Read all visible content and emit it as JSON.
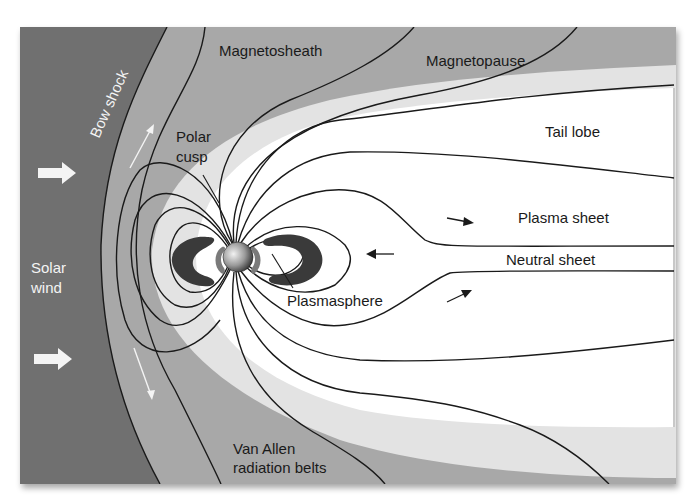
{
  "diagram": {
    "labels": {
      "magnetosheath": "Magnetosheath",
      "magnetopause": "Magnetopause",
      "bow_shock": "Bow shock",
      "polar_cusp_line1": "Polar",
      "polar_cusp_line2": "cusp",
      "tail_lobe": "Tail lobe",
      "plasma_sheet": "Plasma sheet",
      "neutral_sheet": "Neutral sheet",
      "solar_wind_line1": "Solar",
      "solar_wind_line2": "wind",
      "plasmasphere": "Plasmasphere",
      "van_allen_line1": "Van Allen",
      "van_allen_line2": "radiation belts"
    },
    "colors": {
      "solar_wind": "#6f6f6f",
      "magnetosheath": "#a8a8a8",
      "magnetopause_band": "#e3e3e3",
      "magnetosphere_interior": "#ffffff",
      "radiation_belt_outer": "#3a3a3a",
      "radiation_belt_inner": "#7a7a7a",
      "field_lines": "#1a1a1a"
    },
    "icons": {
      "solar_wind_arrows": "right-arrow",
      "flow_arrows": "thin-arrow",
      "earth": "sphere"
    }
  }
}
